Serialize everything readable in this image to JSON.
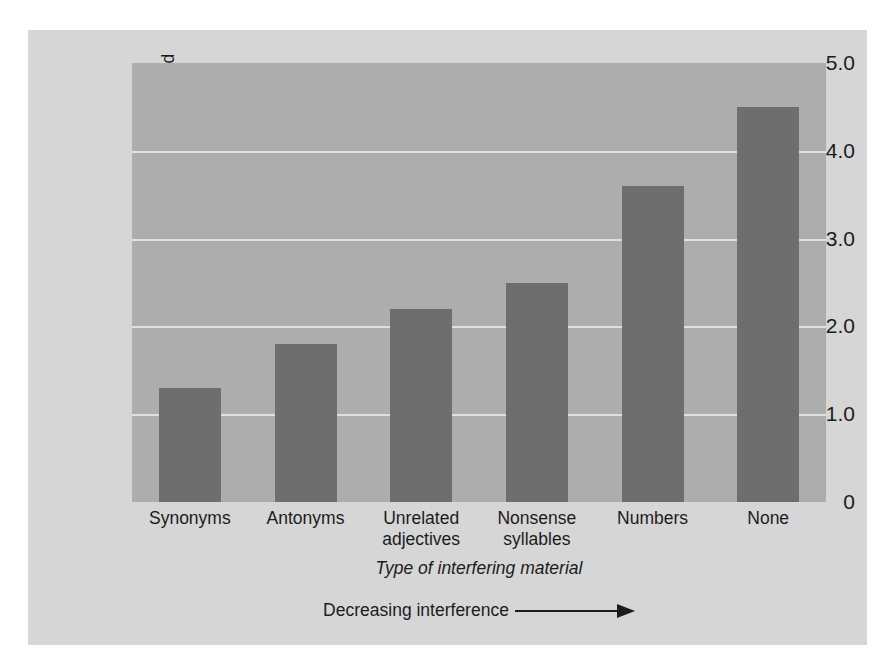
{
  "chart_data": {
    "type": "bar",
    "title": "",
    "categories": [
      "Synonyms",
      "Antonyms",
      "Unrelated adjectives",
      "Nonsense syllables",
      "Numbers",
      "None"
    ],
    "category_lines": [
      [
        "Synonyms"
      ],
      [
        "Antonyms"
      ],
      [
        "Unrelated",
        "adjectives"
      ],
      [
        "Nonsense",
        "syllables"
      ],
      [
        "Numbers"
      ],
      [
        "None"
      ]
    ],
    "values": [
      1.3,
      1.8,
      2.2,
      2.5,
      3.6,
      4.5
    ],
    "xlabel": "Type of interfering material",
    "ylabel": "Mean number of test items recalled",
    "ylim": [
      0,
      5.0
    ],
    "yticks": [
      "0",
      "1.0",
      "2.0",
      "3.0",
      "4.0",
      "5.0"
    ],
    "ytick_values": [
      0,
      1.0,
      2.0,
      3.0,
      4.0,
      5.0
    ],
    "gridlines": [
      1.0,
      2.0,
      3.0,
      4.0
    ],
    "grid": true,
    "legend": "none",
    "annotation": "Decreasing interference",
    "annotation_arrow": "right-arrow",
    "colors": {
      "figure_background": "#d6d6d6",
      "plot_background": "#adadad",
      "bar": "#6e6e6e",
      "gridline": "#e8e8e8",
      "text": "#1c1c1c",
      "page_background": "#ffffff"
    }
  }
}
